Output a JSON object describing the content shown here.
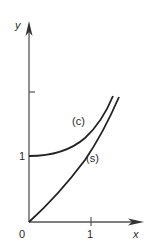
{
  "figure": {
    "axes": {
      "x_label": "x",
      "y_label": "y",
      "origin_label": "0",
      "x_ticks": [
        {
          "value": 1,
          "label": "1"
        }
      ],
      "y_ticks": [
        {
          "value": 1,
          "label": "1"
        },
        {
          "value": 2,
          "label": ""
        }
      ]
    },
    "curves": [
      {
        "id": "c",
        "label": "(c)"
      },
      {
        "id": "s",
        "label": "(s)"
      }
    ],
    "colors": {
      "ink": "#2a2a2a",
      "axis": "#555555",
      "background": "#ffffff"
    }
  }
}
